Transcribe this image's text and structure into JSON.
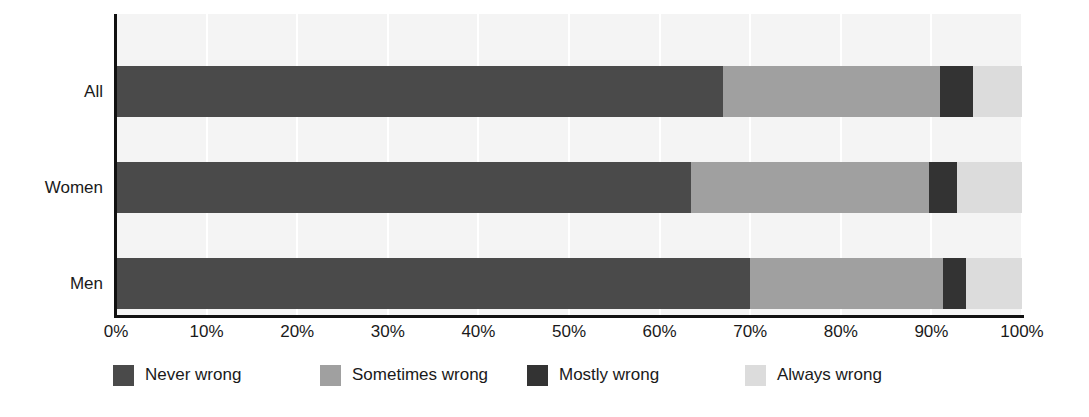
{
  "chart_data": {
    "type": "bar",
    "orientation": "horizontal",
    "stacked": true,
    "normalized_percent": true,
    "title": "",
    "subtitle": "",
    "xlabel": "",
    "ylabel": "",
    "xlim": [
      0,
      100
    ],
    "grid": true,
    "grid_axis": "x",
    "legend_position": "bottom",
    "categories": [
      "All",
      "Women",
      "Men"
    ],
    "xtick_labels": [
      "0%",
      "10%",
      "20%",
      "30%",
      "40%",
      "50%",
      "60%",
      "70%",
      "80%",
      "90%",
      "100%"
    ],
    "xtick_values": [
      0,
      10,
      20,
      30,
      40,
      50,
      60,
      70,
      80,
      90,
      100
    ],
    "series": [
      {
        "name": "Never wrong",
        "color": "#4a4a4a",
        "values": [
          67.0,
          63.5,
          70.0
        ]
      },
      {
        "name": "Sometimes wrong",
        "color": "#a0a0a0",
        "values": [
          24.0,
          26.2,
          21.3
        ]
      },
      {
        "name": "Mostly wrong",
        "color": "#333333",
        "values": [
          3.6,
          3.1,
          2.5
        ]
      },
      {
        "name": "Always wrong",
        "color": "#dcdcdc",
        "values": [
          5.4,
          7.2,
          6.2
        ]
      }
    ]
  },
  "colors": {
    "plot_background": "#f4f4f4",
    "axis": "#111111",
    "gridline": "#ffffff",
    "text": "#1a1a1a",
    "never_wrong": "#4a4a4a",
    "sometimes_wrong": "#a0a0a0",
    "mostly_wrong": "#333333",
    "always_wrong": "#dcdcdc"
  },
  "legend": {
    "items": [
      {
        "label": "Never wrong",
        "color": "#4a4a4a"
      },
      {
        "label": "Sometimes wrong",
        "color": "#a0a0a0"
      },
      {
        "label": "Mostly wrong",
        "color": "#333333"
      },
      {
        "label": "Always wrong",
        "color": "#dcdcdc"
      }
    ]
  }
}
